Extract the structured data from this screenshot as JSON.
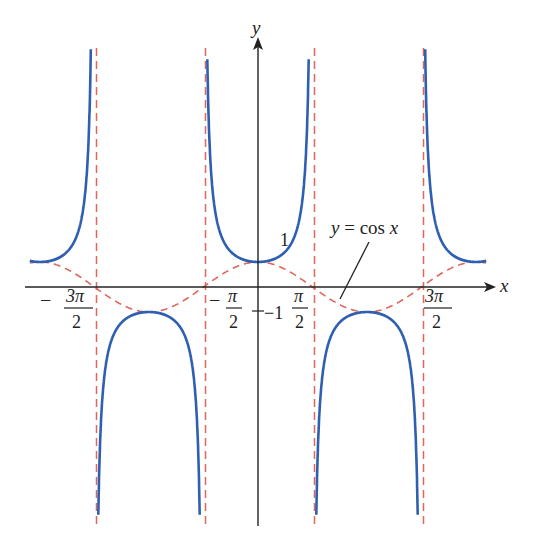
{
  "chart_data": {
    "type": "line",
    "title": "",
    "xlabel": "x",
    "ylabel": "y",
    "series": [
      {
        "name": "y = sec x",
        "function": "1/cos(x)",
        "color": "#2f5fb0",
        "style": "solid"
      },
      {
        "name": "y = cos x",
        "function": "cos(x)",
        "color": "#e0655a",
        "style": "dashed"
      }
    ],
    "asymptotes": {
      "x": [
        "-3π/2",
        "-π/2",
        "π/2",
        "3π/2"
      ],
      "color": "#e0655a",
      "style": "dashed"
    },
    "x_tick_labels": [
      "-3π/2",
      "-π/2",
      "π/2",
      "3π/2"
    ],
    "y_tick_labels": [
      "1",
      "-1"
    ],
    "xlim": [
      -4.2,
      4.5
    ],
    "ylim": [
      -9.5,
      9.5
    ],
    "annotations": [
      "y = cos x"
    ],
    "grid": false,
    "legend": "none"
  },
  "labels": {
    "x_axis": "x",
    "y_axis": "y",
    "one": "1",
    "minus_one": "−1",
    "annotation": "y = cos x",
    "ticks": [
      {
        "sign": "−",
        "num": "3π",
        "den": "2"
      },
      {
        "sign": "−",
        "num": "π",
        "den": "2"
      },
      {
        "sign": "",
        "num": "π",
        "den": "2"
      },
      {
        "sign": "",
        "num": "3π",
        "den": "2"
      }
    ]
  }
}
